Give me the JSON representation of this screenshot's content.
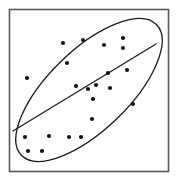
{
  "figure": {
    "type": "scatter-with-confidence-ellipse",
    "width": 178,
    "height": 181,
    "background_color": "#ffffff",
    "title": "",
    "subtitle": "",
    "axis_labels": {
      "x": "",
      "y": ""
    },
    "tick_labels": {
      "x": [],
      "y": []
    },
    "legend": [],
    "annotations": []
  },
  "frame": {
    "name": "plot-border",
    "x": 9.5,
    "y": 9.5,
    "width": 159,
    "height": 162,
    "stroke_color": "#59595b",
    "stroke_width": 1.6,
    "fill_color": "#ffffff"
  },
  "chart_data": {
    "type": "scatter",
    "title": "",
    "xlabel": "",
    "ylabel": "",
    "xlim": [
      9,
      169
    ],
    "ylim": [
      9,
      172
    ],
    "grid": false,
    "legend_position": "none",
    "point_color": "#111111",
    "point_radius": 2.1,
    "point_count": 22,
    "points": [
      {
        "x": 27,
        "y": 78
      },
      {
        "x": 63,
        "y": 43
      },
      {
        "x": 83,
        "y": 40
      },
      {
        "x": 67,
        "y": 63
      },
      {
        "x": 123,
        "y": 38
      },
      {
        "x": 123,
        "y": 48
      },
      {
        "x": 108,
        "y": 73
      },
      {
        "x": 127,
        "y": 70
      },
      {
        "x": 88,
        "y": 89
      },
      {
        "x": 96,
        "y": 85
      },
      {
        "x": 110,
        "y": 88
      },
      {
        "x": 93,
        "y": 99
      },
      {
        "x": 133,
        "y": 104
      },
      {
        "x": 92,
        "y": 119
      },
      {
        "x": 25,
        "y": 137
      },
      {
        "x": 49,
        "y": 136
      },
      {
        "x": 69,
        "y": 137
      },
      {
        "x": 81,
        "y": 137
      },
      {
        "x": 28,
        "y": 151
      },
      {
        "x": 42,
        "y": 151
      },
      {
        "x": 76,
        "y": 86
      },
      {
        "x": 104,
        "y": 45
      }
    ],
    "ellipse": {
      "name": "confidence-ellipse",
      "center_x": 89,
      "center_y": 90,
      "semi_major": 94,
      "semi_minor": 40,
      "rotation_deg": -44,
      "stroke_color": "#1a1a1a",
      "stroke_width": 1.3,
      "fill": "none"
    },
    "trend_line": {
      "name": "regression-line",
      "x1": 13,
      "y1": 131,
      "x2": 156,
      "y2": 44,
      "stroke_color": "#1a1a1a",
      "stroke_width": 1.3,
      "slope": -0.608,
      "interpretation": "positive-association"
    }
  }
}
